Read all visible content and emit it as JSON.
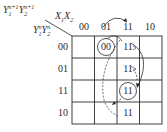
{
  "diagram": {
    "type": "karnaugh-map",
    "corner_label": {
      "next_state": {
        "base1": "Y",
        "sub1": "1",
        "sup1": "n+1",
        "base2": "Y",
        "sub2": "2",
        "sup2": "n+1"
      },
      "inputs": {
        "base1": "X",
        "sub1": "1",
        "base2": "X",
        "sub2": "2"
      },
      "present_state": {
        "base1": "Y",
        "sub1": "1",
        "sup1": "n",
        "base2": "Y",
        "sub2": "2",
        "sup2": "n"
      }
    },
    "columns": [
      "00",
      "01",
      "11",
      "10"
    ],
    "rows": [
      "00",
      "01",
      "11",
      "10"
    ],
    "cells": [
      [
        "",
        "00",
        "11",
        ""
      ],
      [
        "",
        "",
        "11",
        ""
      ],
      [
        "",
        "",
        "11",
        ""
      ],
      [
        "",
        "",
        "11",
        ""
      ]
    ],
    "circled_cells": [
      {
        "row": "00",
        "col": "01",
        "value": "00",
        "note": "stable state"
      },
      {
        "row": "11",
        "col": "11",
        "value": "11",
        "note": "stable state"
      }
    ],
    "transitions": [
      {
        "from": "col 01 header",
        "to": "col 11 header",
        "style": "solid",
        "note": "input change 01 -> 11"
      },
      {
        "from": "row 00 col 11",
        "to": "row 11 col 11",
        "style": "solid",
        "note": "curved arrow on right"
      },
      {
        "from": "row 00 col 01",
        "to": "row 10 col 11",
        "style": "dashed"
      },
      {
        "from": "row 01 col 11",
        "to": "row 11 col 11",
        "style": "dashed"
      }
    ],
    "colors": {
      "ink": "#2a2a2a",
      "background": "#ffffff"
    }
  }
}
